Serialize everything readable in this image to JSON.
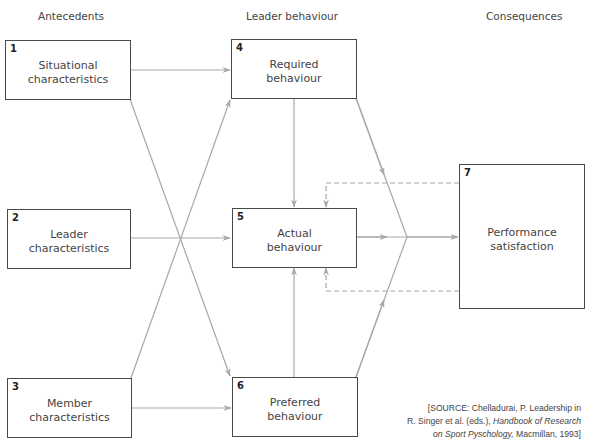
{
  "headers": {
    "antecedents": "Antecedents",
    "leader_behaviour": "Leader behaviour",
    "consequences": "Consequences"
  },
  "boxes": [
    {
      "id": "1",
      "line1": "Situational",
      "line2": "characteristics"
    },
    {
      "id": "2",
      "line1": "Leader",
      "line2": "characteristics"
    },
    {
      "id": "3",
      "line1": "Member",
      "line2": "characteristics"
    },
    {
      "id": "4",
      "line1": "Required",
      "line2": "behaviour"
    },
    {
      "id": "5",
      "line1": "Actual",
      "line2": "behaviour"
    },
    {
      "id": "6",
      "line1": "Preferred",
      "line2": "behaviour"
    },
    {
      "id": "7",
      "line1": "Performance",
      "line2": "satisfaction"
    }
  ],
  "connections": [
    {
      "from": "1",
      "to": "4",
      "style": "solid"
    },
    {
      "from": "1",
      "to": "6",
      "style": "solid"
    },
    {
      "from": "2",
      "to": "5",
      "style": "solid"
    },
    {
      "from": "3",
      "to": "4",
      "style": "solid"
    },
    {
      "from": "3",
      "to": "6",
      "style": "solid"
    },
    {
      "from": "4",
      "to": "5",
      "style": "solid"
    },
    {
      "from": "6",
      "to": "5",
      "style": "solid"
    },
    {
      "from": "4",
      "to": "7",
      "style": "solid",
      "via": "convergence"
    },
    {
      "from": "5",
      "to": "7",
      "style": "solid",
      "via": "convergence"
    },
    {
      "from": "6",
      "to": "7",
      "style": "solid",
      "via": "convergence"
    },
    {
      "from": "7",
      "to": "5",
      "style": "dashed",
      "side": "top"
    },
    {
      "from": "7",
      "to": "5",
      "style": "dashed",
      "side": "bottom"
    }
  ],
  "colors": {
    "line": "#a8a8a8",
    "box_border": "#4a4a4a",
    "text": "#444444"
  },
  "source": {
    "line1": "[SOURCE: Chelladurai, P. Leadership in",
    "line2_pre": "R. Singer et al. (eds.), ",
    "line2_italic": "Handbook of Research",
    "line3_italic": "on Sport Pyschology,",
    "line3_post": " Macmillan, 1993]"
  }
}
